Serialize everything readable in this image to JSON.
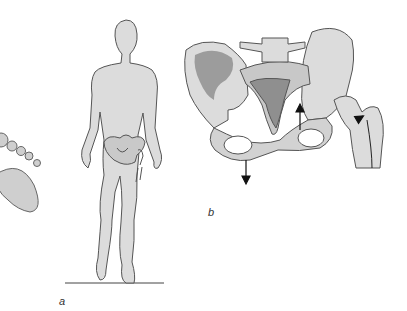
{
  "figure": {
    "panels": [
      {
        "id": "a",
        "label": "a",
        "subject": "standing human figure with pelvis and hip overlay, footprint"
      },
      {
        "id": "b",
        "label": "b",
        "subject": "pelvis and femur with force arrows"
      }
    ],
    "colors": {
      "fill_light": "#dcdcdc",
      "fill_mid": "#c8c8c8",
      "fill_dark": "#9a9a9a",
      "outline": "#555555",
      "arrow": "#111111"
    }
  }
}
